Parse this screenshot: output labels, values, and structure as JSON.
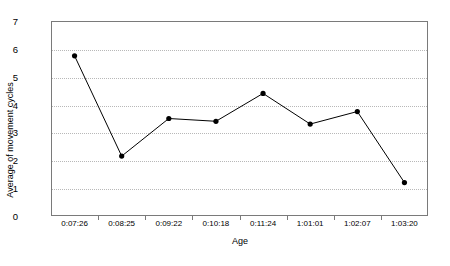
{
  "chart_data": {
    "type": "line",
    "title": "",
    "xlabel": "Age",
    "ylabel": "Average of movement cycles",
    "categories": [
      "0:07:26",
      "0:08:25",
      "0:09:22",
      "0:10:18",
      "0:11:24",
      "1:01:01",
      "1:02:07",
      "1:03:20"
    ],
    "values": [
      5.75,
      2.15,
      3.5,
      3.4,
      4.4,
      3.3,
      3.75,
      1.2
    ],
    "series": [
      {
        "name": "Average of movement cycles",
        "values": [
          5.75,
          2.15,
          3.5,
          3.4,
          4.4,
          3.3,
          3.75,
          1.2
        ]
      }
    ],
    "ylim": [
      0,
      7
    ],
    "yticks": [
      0,
      1,
      2,
      3,
      4,
      5,
      6,
      7
    ],
    "ytick_labels": [
      "0",
      "1",
      "2",
      "3",
      "4",
      "5",
      "6",
      "7"
    ],
    "grid": "horizontal-dotted",
    "legend": "none",
    "line_color": "#000000",
    "marker": "filled-circle",
    "marker_color": "#000000",
    "gridline_color": "#b8b8b8",
    "frame_color": "#7a7a7a",
    "background_color": "#ffffff"
  }
}
